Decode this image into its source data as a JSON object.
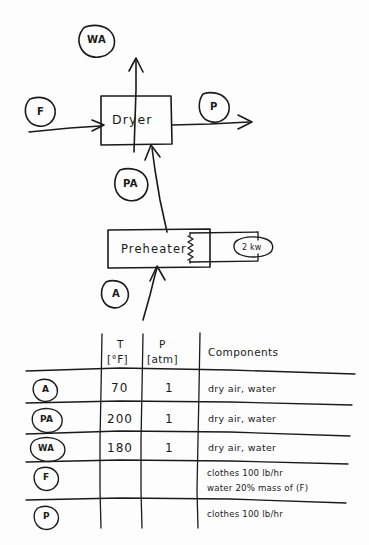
{
  "diagram": {
    "title_note": "",
    "units": [
      {
        "id": "dryer",
        "label": "Dryer"
      },
      {
        "id": "preheater",
        "label": "Preheater"
      }
    ],
    "heater_duty": {
      "label": "2 kw"
    },
    "stream_tags": [
      {
        "id": "wa",
        "label": "WA"
      },
      {
        "id": "f",
        "label": "F"
      },
      {
        "id": "p",
        "label": "P"
      },
      {
        "id": "pa",
        "label": "PA"
      },
      {
        "id": "a",
        "label": "A"
      }
    ]
  },
  "table": {
    "headers": {
      "stream": "",
      "temperature": "T",
      "temperature_units": "[°F]",
      "pressure": "P",
      "pressure_units": "[atm]",
      "components": "Components"
    },
    "rows": [
      {
        "stream": "A",
        "T": "70",
        "P": "1",
        "components_line1": "dry air, water",
        "components_line2": ""
      },
      {
        "stream": "PA",
        "T": "200",
        "P": "1",
        "components_line1": "dry air, water",
        "components_line2": ""
      },
      {
        "stream": "WA",
        "T": "180",
        "P": "1",
        "components_line1": "dry air, water",
        "components_line2": ""
      },
      {
        "stream": "F",
        "T": "",
        "P": "",
        "components_line1": "clothes     100 lb/hr",
        "components_line2": "water    20% mass of (F)"
      },
      {
        "stream": "P",
        "T": "",
        "P": "",
        "components_line1": "clothes  100 lb/hr",
        "components_line2": ""
      }
    ]
  },
  "colors": {
    "ink": "#1a1a1a",
    "paper": "#fdfdfd"
  }
}
